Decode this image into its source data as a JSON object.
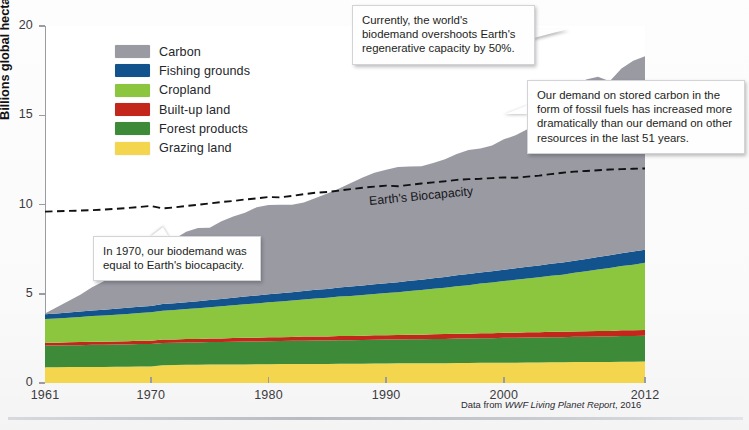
{
  "chart_data": {
    "type": "area",
    "title": "",
    "xlabel": "",
    "ylabel": "Billions global hectares (gha)",
    "xlim": [
      1961,
      2012
    ],
    "ylim": [
      0,
      20
    ],
    "xticks": [
      1961,
      1970,
      1980,
      1990,
      2000,
      2012
    ],
    "yticks": [
      0,
      5,
      10,
      15,
      20
    ],
    "grid": false,
    "legend_position": "upper-left-inside",
    "stacked": true,
    "stack_order_bottom_to_top": [
      "Grazing land",
      "Forest products",
      "Built-up land",
      "Cropland",
      "Fishing grounds",
      "Carbon"
    ],
    "x": [
      1961,
      1962,
      1963,
      1964,
      1965,
      1966,
      1967,
      1968,
      1969,
      1970,
      1971,
      1972,
      1973,
      1974,
      1975,
      1976,
      1977,
      1978,
      1979,
      1980,
      1981,
      1982,
      1983,
      1984,
      1985,
      1986,
      1987,
      1988,
      1989,
      1990,
      1991,
      1992,
      1993,
      1994,
      1995,
      1996,
      1997,
      1998,
      1999,
      2000,
      2001,
      2002,
      2003,
      2004,
      2005,
      2006,
      2007,
      2008,
      2009,
      2010,
      2011,
      2012
    ],
    "series": [
      {
        "name": "Grazing land",
        "color": "#f3d64e",
        "values": [
          0.88,
          0.88,
          0.89,
          0.89,
          0.9,
          0.9,
          0.91,
          0.91,
          0.92,
          0.93,
          1.0,
          1.01,
          1.02,
          1.02,
          1.03,
          1.03,
          1.04,
          1.04,
          1.05,
          1.05,
          1.06,
          1.06,
          1.07,
          1.07,
          1.07,
          1.08,
          1.08,
          1.08,
          1.09,
          1.09,
          1.1,
          1.1,
          1.1,
          1.11,
          1.11,
          1.12,
          1.12,
          1.13,
          1.13,
          1.14,
          1.14,
          1.15,
          1.15,
          1.16,
          1.16,
          1.17,
          1.17,
          1.18,
          1.18,
          1.19,
          1.19,
          1.2
        ]
      },
      {
        "name": "Forest products",
        "color": "#3d8b38",
        "values": [
          1.22,
          1.22,
          1.23,
          1.23,
          1.24,
          1.24,
          1.25,
          1.25,
          1.26,
          1.26,
          1.24,
          1.24,
          1.25,
          1.25,
          1.26,
          1.27,
          1.27,
          1.28,
          1.28,
          1.29,
          1.29,
          1.3,
          1.3,
          1.31,
          1.31,
          1.32,
          1.32,
          1.33,
          1.33,
          1.34,
          1.34,
          1.35,
          1.35,
          1.36,
          1.36,
          1.37,
          1.37,
          1.38,
          1.38,
          1.39,
          1.39,
          1.4,
          1.4,
          1.41,
          1.41,
          1.42,
          1.42,
          1.43,
          1.43,
          1.44,
          1.44,
          1.45
        ]
      },
      {
        "name": "Built-up land",
        "color": "#c3261a",
        "values": [
          0.16,
          0.16,
          0.16,
          0.17,
          0.17,
          0.17,
          0.17,
          0.18,
          0.18,
          0.18,
          0.19,
          0.19,
          0.19,
          0.2,
          0.2,
          0.2,
          0.21,
          0.21,
          0.21,
          0.22,
          0.22,
          0.22,
          0.23,
          0.23,
          0.23,
          0.24,
          0.24,
          0.24,
          0.25,
          0.25,
          0.25,
          0.26,
          0.26,
          0.26,
          0.27,
          0.27,
          0.27,
          0.28,
          0.28,
          0.28,
          0.29,
          0.29,
          0.29,
          0.3,
          0.3,
          0.3,
          0.31,
          0.31,
          0.31,
          0.32,
          0.32,
          0.32
        ]
      },
      {
        "name": "Cropland",
        "color": "#8cc63f",
        "values": [
          1.32,
          1.35,
          1.38,
          1.41,
          1.44,
          1.47,
          1.5,
          1.53,
          1.56,
          1.59,
          1.62,
          1.65,
          1.68,
          1.72,
          1.76,
          1.8,
          1.84,
          1.88,
          1.92,
          1.96,
          2.0,
          2.04,
          2.08,
          2.12,
          2.16,
          2.2,
          2.24,
          2.28,
          2.32,
          2.36,
          2.4,
          2.45,
          2.5,
          2.55,
          2.6,
          2.66,
          2.72,
          2.78,
          2.84,
          2.9,
          2.96,
          3.02,
          3.08,
          3.14,
          3.2,
          3.28,
          3.36,
          3.44,
          3.52,
          3.6,
          3.68,
          3.76
        ]
      },
      {
        "name": "Fishing grounds",
        "color": "#12538d",
        "values": [
          0.27,
          0.28,
          0.29,
          0.3,
          0.31,
          0.32,
          0.33,
          0.34,
          0.35,
          0.36,
          0.37,
          0.38,
          0.38,
          0.39,
          0.4,
          0.41,
          0.42,
          0.43,
          0.44,
          0.45,
          0.46,
          0.47,
          0.48,
          0.49,
          0.5,
          0.51,
          0.52,
          0.53,
          0.54,
          0.55,
          0.56,
          0.57,
          0.58,
          0.59,
          0.6,
          0.61,
          0.62,
          0.62,
          0.63,
          0.64,
          0.65,
          0.65,
          0.66,
          0.67,
          0.68,
          0.68,
          0.69,
          0.7,
          0.71,
          0.72,
          0.73,
          0.74
        ]
      },
      {
        "name": "Carbon",
        "color": "#9a9aa3",
        "values": [
          0.05,
          0.35,
          0.65,
          0.95,
          1.3,
          1.6,
          1.8,
          2.1,
          2.4,
          2.7,
          3.3,
          3.6,
          3.95,
          4.1,
          4.05,
          4.35,
          4.55,
          4.7,
          4.95,
          5.0,
          4.95,
          4.9,
          4.95,
          5.15,
          5.35,
          5.55,
          5.8,
          6.05,
          6.25,
          6.35,
          6.45,
          6.4,
          6.35,
          6.45,
          6.6,
          6.8,
          6.95,
          6.95,
          7.05,
          7.3,
          7.45,
          7.7,
          8.3,
          8.85,
          9.3,
          9.7,
          10.05,
          10.1,
          9.75,
          10.35,
          10.7,
          10.83
        ]
      }
    ],
    "reference_line": {
      "name": "Earth's Biocapacity",
      "label": "Earth's Biocapacity",
      "style": "dashed",
      "color": "#111114",
      "values": [
        9.6,
        9.62,
        9.64,
        9.66,
        9.68,
        9.72,
        9.76,
        9.8,
        9.86,
        9.92,
        9.78,
        9.84,
        9.92,
        9.98,
        10.06,
        10.14,
        10.2,
        10.28,
        10.34,
        10.42,
        10.4,
        10.48,
        10.58,
        10.66,
        10.7,
        10.78,
        10.86,
        10.94,
        11.0,
        11.06,
        11.02,
        11.1,
        11.18,
        11.24,
        11.3,
        11.38,
        11.42,
        11.44,
        11.48,
        11.52,
        11.5,
        11.56,
        11.62,
        11.7,
        11.78,
        11.84,
        11.88,
        11.92,
        11.96,
        11.98,
        12.0,
        12.02
      ]
    }
  },
  "axis": {
    "y_title": "Billions global hectares (gha)",
    "y_ticks": [
      "20",
      "15",
      "10",
      "5",
      "0"
    ],
    "x_ticks": [
      "1961",
      "1970",
      "1980",
      "1990",
      "2000",
      "2012"
    ]
  },
  "legend": {
    "items": [
      {
        "label": "Carbon",
        "color": "#9a9aa3"
      },
      {
        "label": "Fishing grounds",
        "color": "#12538d"
      },
      {
        "label": "Cropland",
        "color": "#8cc63f"
      },
      {
        "label": "Built-up land",
        "color": "#c3261a"
      },
      {
        "label": "Forest products",
        "color": "#3d8b38"
      },
      {
        "label": "Grazing land",
        "color": "#f3d64e"
      }
    ]
  },
  "annotations": {
    "overshoot": "Currently, the world's biodemand overshoots Earth's regenerative capacity by 50%.",
    "carbon": "Our demand on stored carbon in the form of fossil fuels has increased more dramatically than our demand on other resources in the last 51 years.",
    "year1970": "In 1970, our biodemand was equal to Earth's biocapacity.",
    "biocapacity_line_label": "Earth's Biocapacity"
  },
  "source": {
    "prefix": "Data from ",
    "italic": "WWF Living Planet Report",
    "suffix": ", 2016"
  }
}
